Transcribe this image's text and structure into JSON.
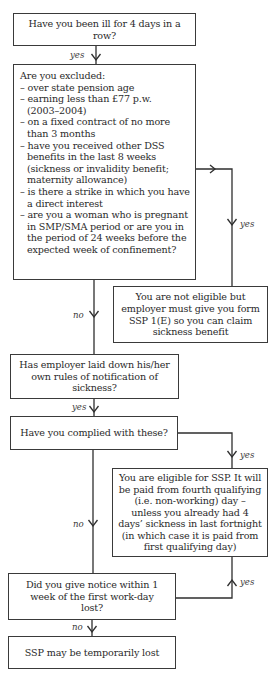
{
  "diagram": {
    "type": "flowchart",
    "nodes": {
      "ill_question": {
        "text": "Have you been ill for 4 days in a row?"
      },
      "excluded": {
        "title": "Are you excluded:",
        "lines": [
          "– over state pension age",
          "– earning less than £77 p.w.",
          "(2003–2004)",
          "– on a fixed contract of no more",
          "than 3 months",
          "– have you received other DSS",
          "benefits in the last 8 weeks",
          "(sickness or invalidity benefit;",
          "maternity allowance)",
          "– is there a strike in which you have",
          "a direct interest",
          "– are you a woman who is pregnant",
          "in SMP/SMA period or are you in",
          "the period of 24 weeks before the",
          "expected week of confinement?"
        ]
      },
      "not_eligible": {
        "text": "You are not eligible but employer must give you form SSP 1(E) so you can claim sickness benefit"
      },
      "employer_rules": {
        "text": "Has employer laid down his/her own rules of notification of sickness?"
      },
      "complied": {
        "text": "Have you complied with these?"
      },
      "eligible": {
        "text": "You are eligible for SSP. It will be paid from fourth qualifying (i.e. non-working) day – unless you already had 4 days’ sickness in last fortnight (in which case it is paid from first qualifying day)"
      },
      "notice": {
        "text": "Did you give notice within 1 week of the first work-day lost?"
      },
      "ssp_lost": {
        "text": "SSP may be temporarily lost"
      }
    },
    "edges": {
      "ill_to_excluded": "yes",
      "excluded_to_not_eligible": "yes",
      "excluded_to_employer_rules": "no",
      "employer_rules_to_complied": "yes",
      "complied_to_eligible": "yes",
      "complied_to_notice": "no",
      "notice_to_eligible": "yes",
      "notice_to_ssp_lost": "no"
    },
    "colors": {
      "stroke": "#2e2e2e",
      "text": "#2a2a2a",
      "background": "#ffffff"
    }
  }
}
